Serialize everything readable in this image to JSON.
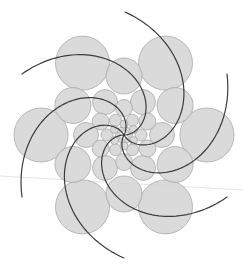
{
  "figure": {
    "width": 243,
    "height": 271,
    "background": "#ffffff",
    "circle_fill": "#d4d4d4",
    "circle_stroke": "#a9a9a9",
    "arm_color": "#3c3c3c",
    "center": [
      124,
      135
    ],
    "rings": [
      {
        "distance": 83,
        "radius": 27,
        "count": 6,
        "start_angle_deg": -120
      },
      {
        "distance": 59,
        "radius": 18,
        "count": 6,
        "start_angle_deg": -90
      },
      {
        "distance": 38,
        "radius": 12.5,
        "count": 6,
        "start_angle_deg": -60
      },
      {
        "distance": 27,
        "radius": 8.5,
        "count": 6,
        "start_angle_deg": -90
      },
      {
        "distance": 17,
        "radius": 6,
        "count": 6,
        "start_angle_deg": -60
      },
      {
        "distance": 11,
        "radius": 4,
        "count": 6,
        "start_angle_deg": -90
      },
      {
        "distance": 6,
        "radius": 2.5,
        "count": 6,
        "start_angle_deg": -60
      }
    ],
    "spiral_arms": {
      "count": 6,
      "end_points": [
        [
          125,
          12
        ],
        [
          227,
          74
        ],
        [
          227,
          197
        ],
        [
          124,
          258
        ],
        [
          22,
          197
        ],
        [
          22,
          74
        ]
      ],
      "outer_radius": 123,
      "turn_deg": 150
    },
    "artifact_line": [
      [
        0,
        176
      ],
      [
        243,
        190
      ]
    ]
  }
}
